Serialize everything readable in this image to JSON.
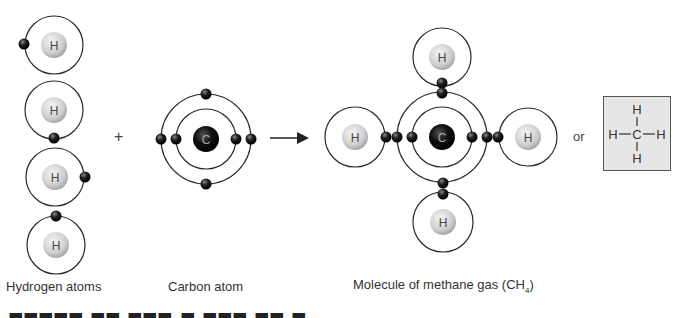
{
  "colors": {
    "orbit": "#2a2a2a",
    "electron": "#1a1a1a",
    "h_nucleus": "#d0d0d0",
    "c_nucleus": "#111111",
    "nucleus_label_dark": "#444444",
    "nucleus_label_light": "#aaaaaa",
    "box_fill": "#e6e6e6",
    "box_border": "#555555"
  },
  "hydrogen_atoms": {
    "caption": "Hydrogen atoms",
    "atoms": [
      {
        "label": "H",
        "cx": 54,
        "cy": 45,
        "orbit_r": 29,
        "electron": {
          "x": 24,
          "y": 44
        }
      },
      {
        "label": "H",
        "cx": 54,
        "cy": 110,
        "orbit_r": 29,
        "electron": {
          "x": 54,
          "y": 138
        }
      },
      {
        "label": "H",
        "cx": 55,
        "cy": 177,
        "orbit_r": 29,
        "electron": {
          "x": 85,
          "y": 177
        }
      },
      {
        "label": "H",
        "cx": 56,
        "cy": 245,
        "orbit_r": 29,
        "electron": {
          "x": 56,
          "y": 216
        }
      }
    ]
  },
  "operators": {
    "plus": "+",
    "or": "or"
  },
  "carbon_atom": {
    "caption": "Carbon atom",
    "label": "C",
    "cx": 206,
    "cy": 139,
    "inner_r": 30,
    "outer_r": 45,
    "electrons": [
      {
        "x": 176,
        "y": 139
      },
      {
        "x": 236,
        "y": 139
      },
      {
        "x": 161,
        "y": 139
      },
      {
        "x": 251,
        "y": 139
      },
      {
        "x": 206,
        "y": 94
      },
      {
        "x": 206,
        "y": 184
      }
    ]
  },
  "arrow": {
    "x1": 270,
    "y1": 138,
    "x2": 310,
    "y2": 138
  },
  "methane": {
    "caption_main": "Molecule of methane gas (CH",
    "caption_sub": "4",
    "caption_end": ")",
    "carbon": {
      "label": "C",
      "cx": 442,
      "cy": 137,
      "inner_r": 30,
      "outer_r": 45,
      "inner_electrons": [
        {
          "x": 412,
          "y": 137
        },
        {
          "x": 472,
          "y": 137
        }
      ]
    },
    "hydrogens": [
      {
        "position": "top",
        "label": "H",
        "cx": 442,
        "cy": 57,
        "orbit_r": 29
      },
      {
        "position": "left",
        "label": "H",
        "cx": 355,
        "cy": 137,
        "orbit_r": 30
      },
      {
        "position": "right",
        "label": "H",
        "cx": 528,
        "cy": 137,
        "orbit_r": 29
      },
      {
        "position": "bottom",
        "label": "H",
        "cx": 443,
        "cy": 222,
        "orbit_r": 30
      }
    ],
    "shared_electrons": [
      {
        "x": 442,
        "y": 83
      },
      {
        "x": 442,
        "y": 93
      },
      {
        "x": 386,
        "y": 137
      },
      {
        "x": 397,
        "y": 137
      },
      {
        "x": 487,
        "y": 137
      },
      {
        "x": 498,
        "y": 137
      },
      {
        "x": 443,
        "y": 183
      },
      {
        "x": 443,
        "y": 194
      }
    ]
  },
  "structural_formula": {
    "top": "H",
    "left": "H",
    "center": "C",
    "right": "H",
    "bottom": "H"
  },
  "cut_off_line": "Figure caption text (clipped at bottom edge)"
}
